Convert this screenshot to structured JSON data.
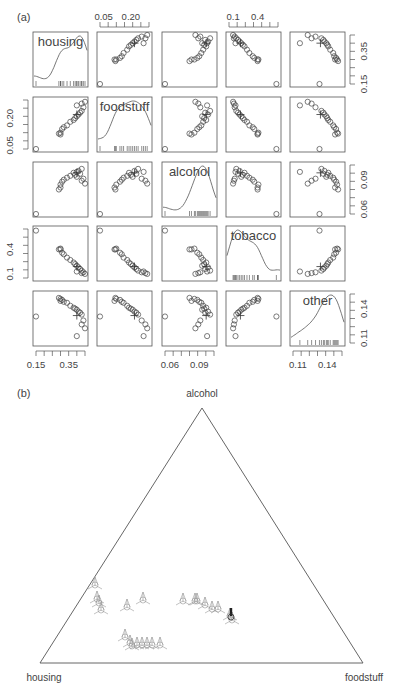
{
  "panel_labels": {
    "a": "(a)",
    "b": "(b)"
  },
  "chart_data": [
    {
      "type": "scatter",
      "subtype": "scatterplot-matrix",
      "title": "(a)",
      "variables": [
        "housing",
        "foodstuff",
        "alcohol",
        "tobacco",
        "other"
      ],
      "diagonal": "kernel density with rug",
      "axis_ticks": {
        "housing": {
          "labels": [
            "0.15",
            "0.35"
          ],
          "side": "bottom-left / right"
        },
        "foodstuff": {
          "labels": [
            "0.05",
            "0.20"
          ],
          "side": "top / left"
        },
        "alcohol": {
          "labels": [
            "0.06",
            "0.09"
          ],
          "side": "bottom / right"
        },
        "tobacco": {
          "labels": [
            "0.1",
            "0.4"
          ],
          "side": "top / left"
        },
        "other": {
          "labels": [
            "0.11",
            "0.14"
          ],
          "side": "bottom / right"
        }
      },
      "ranges": {
        "housing": [
          0.15,
          0.45
        ],
        "foodstuff": [
          0.03,
          0.3
        ],
        "alcohol": [
          0.055,
          0.105
        ],
        "tobacco": [
          0.05,
          0.65
        ],
        "other": [
          0.105,
          0.155
        ]
      },
      "observations": [
        {
          "housing": 0.15,
          "foodstuff": 0.03,
          "alcohol": 0.055,
          "tobacco": 0.63,
          "other": 0.132
        },
        {
          "housing": 0.3,
          "foodstuff": 0.11,
          "alcohol": 0.082,
          "tobacco": 0.4,
          "other": 0.148
        },
        {
          "housing": 0.3,
          "foodstuff": 0.12,
          "alcohol": 0.085,
          "tobacco": 0.41,
          "other": 0.15
        },
        {
          "housing": 0.29,
          "foodstuff": 0.115,
          "alcohol": 0.08,
          "tobacco": 0.4,
          "other": 0.151
        },
        {
          "housing": 0.31,
          "foodstuff": 0.14,
          "alcohol": 0.088,
          "tobacco": 0.36,
          "other": 0.149
        },
        {
          "housing": 0.32,
          "foodstuff": 0.15,
          "alcohol": 0.09,
          "tobacco": 0.34,
          "other": 0.147
        },
        {
          "housing": 0.34,
          "foodstuff": 0.16,
          "alcohol": 0.092,
          "tobacco": 0.3,
          "other": 0.146
        },
        {
          "housing": 0.36,
          "foodstuff": 0.18,
          "alcohol": 0.094,
          "tobacco": 0.27,
          "other": 0.143
        },
        {
          "housing": 0.38,
          "foodstuff": 0.19,
          "alcohol": 0.097,
          "tobacco": 0.24,
          "other": 0.141
        },
        {
          "housing": 0.39,
          "foodstuff": 0.2,
          "alcohol": 0.095,
          "tobacco": 0.22,
          "other": 0.14
        },
        {
          "housing": 0.4,
          "foodstuff": 0.21,
          "alcohol": 0.093,
          "tobacco": 0.2,
          "other": 0.139
        },
        {
          "housing": 0.41,
          "foodstuff": 0.22,
          "alcohol": 0.099,
          "tobacco": 0.18,
          "other": 0.137
        },
        {
          "housing": 0.42,
          "foodstuff": 0.23,
          "alcohol": 0.096,
          "tobacco": 0.16,
          "other": 0.136
        },
        {
          "housing": 0.43,
          "foodstuff": 0.24,
          "alcohol": 0.101,
          "tobacco": 0.14,
          "other": 0.134
        },
        {
          "housing": 0.44,
          "foodstuff": 0.26,
          "alcohol": 0.091,
          "tobacco": 0.12,
          "other": 0.128
        },
        {
          "housing": 0.43,
          "foodstuff": 0.28,
          "alcohol": 0.089,
          "tobacco": 0.11,
          "other": 0.124
        },
        {
          "housing": 0.4,
          "foodstuff": 0.27,
          "alcohol": 0.098,
          "tobacco": 0.13,
          "other": 0.112
        },
        {
          "housing": 0.45,
          "foodstuff": 0.29,
          "alcohol": 0.086,
          "tobacco": 0.1,
          "other": 0.12
        }
      ],
      "special_marker": {
        "symbol": "+",
        "housing": 0.4,
        "foodstuff": 0.22,
        "alcohol": 0.097,
        "tobacco": 0.19,
        "other": 0.133
      }
    },
    {
      "type": "scatter",
      "subtype": "ternary",
      "title": "(b)",
      "vertices": {
        "top": "alcohol",
        "bottom_left": "housing",
        "bottom_right": "foodstuff"
      },
      "points_xy_px": [
        [
          95,
          585
        ],
        [
          97,
          599
        ],
        [
          99,
          603
        ],
        [
          101,
          610
        ],
        [
          127,
          607
        ],
        [
          143,
          600
        ],
        [
          125,
          637
        ],
        [
          130,
          643
        ],
        [
          132,
          646
        ],
        [
          137,
          645
        ],
        [
          142,
          645
        ],
        [
          147,
          645
        ],
        [
          152,
          645
        ],
        [
          160,
          645
        ],
        [
          183,
          601
        ],
        [
          195,
          601
        ],
        [
          197,
          601
        ],
        [
          205,
          605
        ],
        [
          212,
          609
        ],
        [
          218,
          609
        ],
        [
          230,
          616
        ],
        [
          232,
          620
        ]
      ],
      "highlighted_point_xy_px": [
        231,
        617
      ]
    }
  ],
  "caption_fragment": "Figure 4.5 ... (cut off)"
}
